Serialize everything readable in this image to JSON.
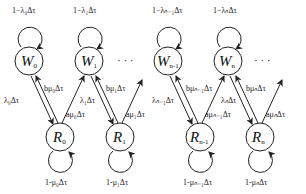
{
  "diagram": {
    "type": "state-transition",
    "nodes": {
      "w0": {
        "label": "W",
        "sub": "0"
      },
      "w1": {
        "label": "W",
        "sub": "1"
      },
      "wn1": {
        "label": "W",
        "sub": "n-1"
      },
      "wn": {
        "label": "W",
        "sub": "n"
      },
      "r0": {
        "label": "R",
        "sub": "0"
      },
      "r1": {
        "label": "R",
        "sub": "1"
      },
      "rn1": {
        "label": "R",
        "sub": "n-1"
      },
      "rn": {
        "label": "R",
        "sub": "n"
      }
    },
    "self_loops": {
      "w0": "1−λ₀Δτ",
      "w1": "1−λ₁Δτ",
      "wn1": "1−λₙ₋₁Δτ",
      "wn": "1−λₙΔτ",
      "r0": "1-μ₀Δτ",
      "r1": "1-μ₁Δτ",
      "rn1": "1-μₙ₋₁Δτ",
      "rn": "1-μₙΔτ"
    },
    "down_edges": {
      "w0_r0": "λ₀Δτ",
      "w1_r1": "λ₁Δτ",
      "wn1_rn1": "λₙ₋₁Δτ",
      "wn_rn": "λₙΔτ"
    },
    "up_back_edges": {
      "r0_w0": "bμ₀Δτ",
      "r1_w1": "bμ₁Δτ",
      "rn1_wn1": "bμₙ₋₁Δτ",
      "rn_wn": "bμₙΔτ"
    },
    "up_forward_edges": {
      "r0_w1": "aμ₀Δτ",
      "r1_w2": "aμ₁Δτ",
      "rn1_wn": "aμₙ₋₁Δτ",
      "rn_wn1": "aμₙΔτ"
    },
    "ellipsis": "· · ·"
  }
}
